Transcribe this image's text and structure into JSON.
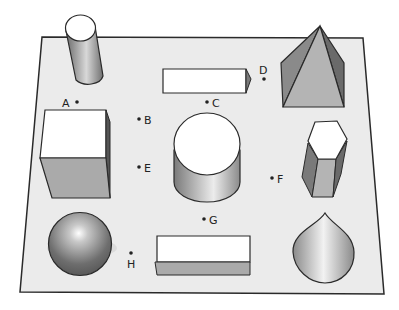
{
  "figure": {
    "board_color": "#ebebeb",
    "outline_color": "#2a2a2a"
  },
  "shapes": [
    {
      "id": "cylinder-small",
      "label": "tall cylinder"
    },
    {
      "id": "rect-prism-top",
      "label": "rectangular prism"
    },
    {
      "id": "pyramid",
      "label": "square pyramid"
    },
    {
      "id": "cube",
      "label": "cube"
    },
    {
      "id": "cylinder-large",
      "label": "cylinder"
    },
    {
      "id": "hex-prism",
      "label": "hexagonal prism"
    },
    {
      "id": "sphere",
      "label": "sphere"
    },
    {
      "id": "rect-prism-bottom",
      "label": "rectangular prism"
    },
    {
      "id": "cone",
      "label": "cone"
    }
  ],
  "points": {
    "A": "A",
    "B": "B",
    "C": "C",
    "D": "D",
    "E": "E",
    "F": "F",
    "G": "G",
    "H": "H"
  }
}
